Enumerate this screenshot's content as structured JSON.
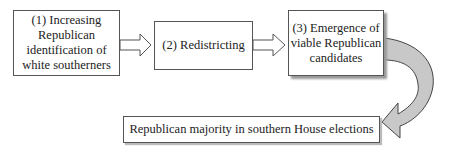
{
  "diagram": {
    "steps": [
      {
        "id": "1",
        "label": "(1) Increasing Republican identification of white southerners"
      },
      {
        "id": "2",
        "label": "(2) Redistricting"
      },
      {
        "id": "3",
        "label": "(3) Emergence of viable Republican candidates"
      }
    ],
    "outcome": {
      "label": "Republican majority in southern House elections"
    },
    "arrows": [
      {
        "from": "1",
        "to": "2",
        "style": "hollow-block"
      },
      {
        "from": "2",
        "to": "3",
        "style": "hollow-block"
      },
      {
        "from": "3",
        "to": "outcome",
        "style": "curved-gray"
      }
    ],
    "colors": {
      "curve_fill": "#c8c8c8",
      "border": "#555555"
    }
  }
}
